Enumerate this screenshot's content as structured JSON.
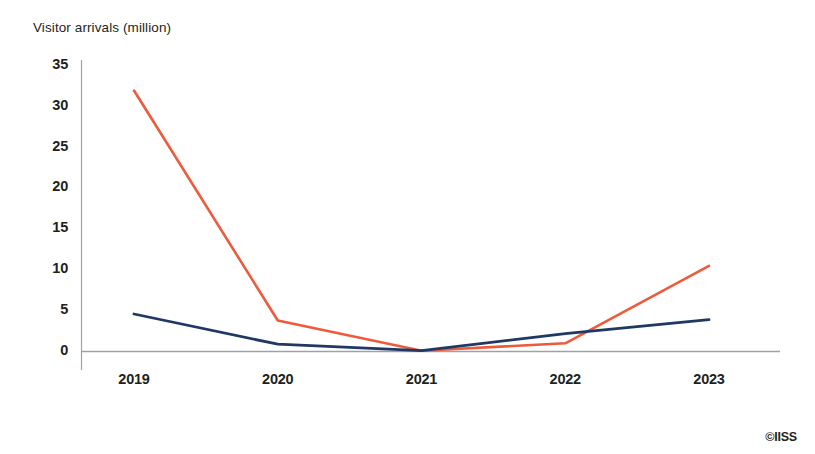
{
  "chart_data": {
    "type": "line",
    "title": "Visitor arrivals (million)",
    "xlabel": "",
    "ylabel": "Visitor arrivals (million)",
    "categories": [
      "2019",
      "2020",
      "2021",
      "2022",
      "2023"
    ],
    "x_tick_labels": [
      "2019",
      "2020",
      "2021",
      "2022",
      "2023"
    ],
    "y_tick_labels": [
      "0",
      "5",
      "10",
      "15",
      "20",
      "25",
      "30",
      "35"
    ],
    "y_ticks": [
      0,
      5,
      10,
      15,
      20,
      25,
      30,
      35
    ],
    "ylim": [
      0,
      35
    ],
    "grid": false,
    "legend": false,
    "series": [
      {
        "name": "series-red",
        "color": "#ED5B3C",
        "values": [
          32.0,
          3.8,
          0.1,
          1.0,
          10.5
        ]
      },
      {
        "name": "series-navy",
        "color": "#1F3864",
        "values": [
          4.6,
          0.9,
          0.1,
          2.2,
          3.9
        ]
      }
    ]
  },
  "credit": {
    "text": "©IISS"
  },
  "colors": {
    "red": "#ED5B3C",
    "navy": "#1F3864",
    "axis": "#9aa3ad",
    "text": "#231f20"
  }
}
